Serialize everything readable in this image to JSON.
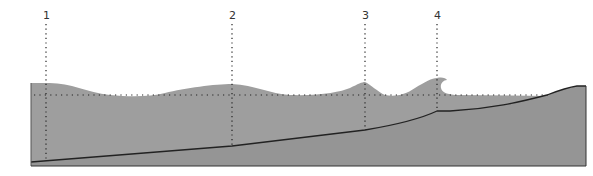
{
  "diagram": {
    "colors": {
      "water": "#9e9e9e",
      "seabed": "#8f8f8f",
      "line": "#222222",
      "background": "#ffffff"
    },
    "markers": [
      {
        "label": "1",
        "x": 46
      },
      {
        "label": "2",
        "x": 232
      },
      {
        "label": "3",
        "x": 365
      },
      {
        "label": "4",
        "x": 437
      }
    ],
    "still_water_level": "dotted horizontal line"
  }
}
